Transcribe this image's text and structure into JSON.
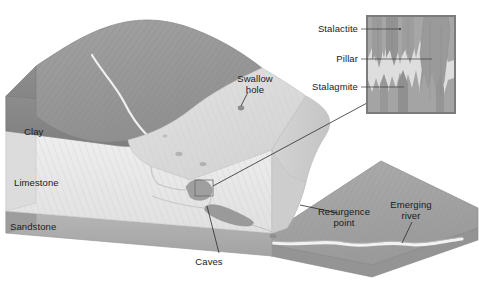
{
  "figure": {
    "background_color": "#ffffff"
  },
  "strata_labels": [
    {
      "name": "clay",
      "text": "Clay",
      "x": 24,
      "y": 135,
      "color": "#8e8e8e"
    },
    {
      "name": "limestone",
      "text": "Limestone",
      "x": 14,
      "y": 186,
      "color": "#e3e3e3"
    },
    {
      "name": "sandstone",
      "text": "Sandstone",
      "x": 10,
      "y": 230,
      "color": "#a8a8a8"
    }
  ],
  "callouts": [
    {
      "name": "swallow-hole",
      "line1": "Swallow",
      "line2": "hole",
      "x": 255,
      "y": 82
    },
    {
      "name": "caves",
      "line1": "Caves",
      "line2": "",
      "x": 209,
      "y": 262
    },
    {
      "name": "resurgence-point",
      "line1": "Resurgence",
      "line2": "point",
      "x": 344,
      "y": 215
    },
    {
      "name": "emerging-river",
      "line1": "Emerging",
      "line2": "river",
      "x": 411,
      "y": 208
    }
  ],
  "inset": {
    "frame": {
      "x": 367,
      "y": 16,
      "width": 88,
      "height": 97,
      "border_color": "#7c7c7c"
    },
    "labels": [
      {
        "name": "stalactite",
        "text": "Stalactite",
        "x": 358,
        "y": 32
      },
      {
        "name": "pillar",
        "text": "Pillar",
        "x": 358,
        "y": 62
      },
      {
        "name": "stalagmite",
        "text": "Stalagmite",
        "x": 358,
        "y": 90
      }
    ]
  },
  "palette": {
    "clay_top": "#9a9a9a",
    "clay_face": "#8a8a8a",
    "limestone_top": "#dcdcdc",
    "limestone_face": "#ebebeb",
    "limestone_side": "#cfcfcf",
    "sandstone": "#b0b0b0",
    "valley_floor": "#a5a5a5",
    "river_white": "#f4f4f4",
    "cave_grey": "#9d9d9d",
    "outline": "#6e6e6e",
    "text": "#1b1b1b"
  }
}
